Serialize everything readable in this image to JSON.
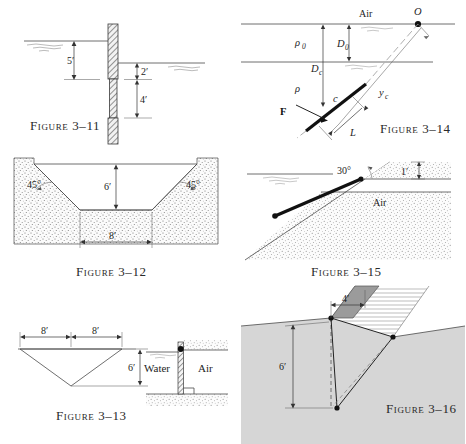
{
  "page": {
    "background_color": "#ffffff",
    "width": 466,
    "height": 444
  },
  "figures": [
    {
      "id": "fig-3-11",
      "caption_prefix": "Figure",
      "caption_number": "3–11",
      "caption": "Figure 3–11",
      "labels": [
        "5′",
        "2′",
        "4′"
      ],
      "dimensions": [
        {
          "label": "5′",
          "orientation": "vertical"
        },
        {
          "label": "2′",
          "orientation": "vertical"
        },
        {
          "label": "4′",
          "orientation": "vertical"
        }
      ]
    },
    {
      "id": "fig-3-14",
      "caption_prefix": "Figure",
      "caption_number": "3–14",
      "caption": "Figure 3–14",
      "labels": [
        "Air",
        "O",
        "ρ₀",
        "D₀",
        "D",
        "c",
        "ρ",
        "F",
        "L",
        "y",
        "c"
      ],
      "text_air": "Air",
      "text_origin": "O",
      "text_rho0": "ρ",
      "text_rho0_sub": "0",
      "text_D0": "D",
      "text_D0_sub": "0",
      "text_Dc": "D",
      "text_Dc_sub": "c",
      "text_rho": "ρ",
      "text_centroid": "c",
      "text_force": "F",
      "text_L": "L",
      "text_yc": "y",
      "text_yc_sub": "c"
    },
    {
      "id": "fig-3-12",
      "caption_prefix": "Figure",
      "caption_number": "3–12",
      "caption": "Figure 3–12",
      "labels": [
        "45°",
        "6′",
        "45°",
        "8′"
      ],
      "angle_left": "45°",
      "angle_right": "45°",
      "depth": "6′",
      "bottom_width": "8′"
    },
    {
      "id": "fig-3-15",
      "caption_prefix": "Figure",
      "caption_number": "3–15",
      "caption": "Figure 3–15",
      "labels": [
        "30°",
        "1′",
        "Air"
      ],
      "angle": "30°",
      "height": "1′",
      "medium": "Air"
    },
    {
      "id": "fig-3-13",
      "caption_prefix": "Figure",
      "caption_number": "3–13",
      "caption": "Figure 3–13",
      "labels": [
        "8′",
        "8′",
        "6′",
        "Water",
        "Air"
      ],
      "half_width_left": "8′",
      "half_width_right": "8′",
      "depth": "6′",
      "left_medium": "Water",
      "right_medium": "Air"
    },
    {
      "id": "fig-3-16",
      "caption_prefix": "Figure",
      "caption_number": "3–16",
      "caption": "Figure 3–16",
      "labels": [
        "4′",
        "6′"
      ],
      "width": "4′",
      "depth": "6′"
    }
  ],
  "colors": {
    "line": "#4a4a4a",
    "dark_line": "#222222",
    "dashed": "#9a9a9a",
    "stipple": "#707070",
    "ground_gray": "#d3d3d3",
    "plate_gray": "#9a9a9a",
    "text": "#1d1d1d"
  }
}
